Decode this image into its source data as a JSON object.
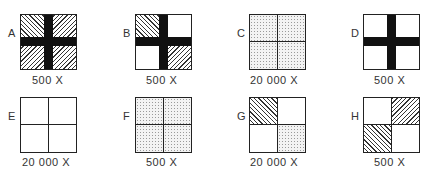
{
  "figure": {
    "panels": [
      {
        "id": "A",
        "label": "A",
        "magnification": "500 X",
        "quadrants": {
          "tl": "hatch-forward",
          "tr": "hatch-back",
          "bl": "hatch-back",
          "br": "hatch-back"
        },
        "dark_cross": true
      },
      {
        "id": "B",
        "label": "B",
        "magnification": "500 X",
        "quadrants": {
          "tl": "hatch-forward",
          "tr": "plain",
          "bl": "plain",
          "br": "hatch-back"
        },
        "dark_cross": true
      },
      {
        "id": "C",
        "label": "C",
        "magnification": "20 000 X",
        "quadrants": {
          "tl": "dotted",
          "tr": "dotted",
          "bl": "dotted",
          "br": "dotted"
        },
        "dark_cross": false
      },
      {
        "id": "D",
        "label": "D",
        "magnification": "500 X",
        "quadrants": {
          "tl": "plain",
          "tr": "plain",
          "bl": "plain",
          "br": "plain"
        },
        "dark_cross": true
      },
      {
        "id": "E",
        "label": "E",
        "magnification": "20 000 X",
        "quadrants": {
          "tl": "plain",
          "tr": "plain",
          "bl": "plain",
          "br": "plain"
        },
        "dark_cross": false
      },
      {
        "id": "F",
        "label": "F",
        "magnification": "500 X",
        "quadrants": {
          "tl": "dotted",
          "tr": "dotted",
          "bl": "dotted",
          "br": "dotted"
        },
        "dark_cross": false
      },
      {
        "id": "G",
        "label": "G",
        "magnification": "20 000 X",
        "quadrants": {
          "tl": "hatch-forward",
          "tr": "plain",
          "bl": "plain",
          "br": "dotted"
        },
        "dark_cross": false
      },
      {
        "id": "H",
        "label": "H",
        "magnification": "500 X",
        "quadrants": {
          "tl": "plain",
          "tr": "hatch-back",
          "bl": "hatch-forward",
          "br": "plain"
        },
        "dark_cross": false
      }
    ]
  }
}
